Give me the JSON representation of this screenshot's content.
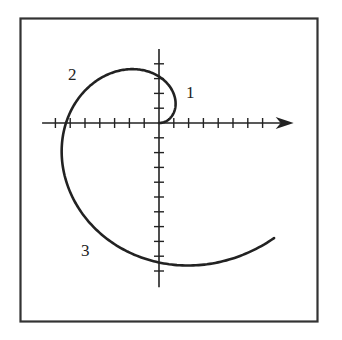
{
  "figure": {
    "type": "polar spiral plot",
    "curve": "Archimedean spiral r = 2θ",
    "theta_start": 0,
    "theta_end_fraction_of_pi": 1.75,
    "labels": [
      {
        "text": "1",
        "x": 186,
        "y": 98
      },
      {
        "text": "2",
        "x": 72,
        "y": 80
      },
      {
        "text": "3",
        "x": 83,
        "y": 256
      }
    ],
    "axes": {
      "origin_px": [
        159,
        123
      ],
      "unit_px": 14.8,
      "x_ticks_left": 7,
      "x_ticks_right": 7,
      "y_ticks_up": 4,
      "y_ticks_down": 10,
      "x_axis_arrow": true
    },
    "colors": {
      "stroke": "#222222",
      "frame": "#333333",
      "background": "#ffffff"
    }
  }
}
